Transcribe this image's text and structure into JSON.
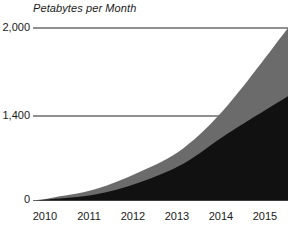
{
  "chart_data": {
    "type": "area",
    "title": "Petabytes per Month",
    "subtitle": "",
    "xlabel": "",
    "ylabel": "Petabytes per Month",
    "stacked": false,
    "grid": true,
    "legend_position": "none",
    "xlim": [
      2009.6,
      2015.35
    ],
    "ylim": [
      0,
      2000
    ],
    "yticks": [
      0,
      1400,
      2000
    ],
    "ytick_labels": [
      "0",
      "1,400",
      "2,000"
    ],
    "xticks": [
      2010,
      2011,
      2012,
      2013,
      2014,
      2015
    ],
    "xtick_labels": [
      "2010",
      "2011",
      "2012",
      "2013",
      "2014",
      "2015"
    ],
    "categories": [
      "2010",
      "2011",
      "2012",
      "2013",
      "2014",
      "2015"
    ],
    "x": [
      2010,
      2011,
      2012,
      2013,
      2014,
      2015.35
    ],
    "series": [
      {
        "name": "Total traffic",
        "color": "#6b6b6b",
        "values": [
          30,
          130,
          330,
          610,
          1110,
          2000
        ]
      },
      {
        "name": "Lower band",
        "color": "#111111",
        "values": [
          15,
          70,
          210,
          430,
          780,
          1210
        ]
      }
    ],
    "colors": {
      "upper_area": "#6b6b6b",
      "lower_area": "#111111",
      "gridline": "#6b6b6b",
      "axis": "#6b6b6b",
      "text": "#1a1a1a",
      "background": "#ffffff"
    }
  },
  "axis": {
    "y_labels": [
      "2,000",
      "1,400",
      "0"
    ],
    "x_labels": [
      "2010",
      "2011",
      "2012",
      "2013",
      "2014",
      "2015"
    ]
  },
  "title": "Petabytes per Month"
}
